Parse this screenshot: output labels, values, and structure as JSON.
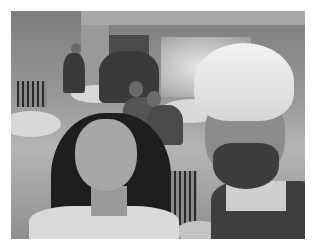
{
  "image": {
    "description": "Grayscale selfie of two people at an indoor event hall; a woman with long dark hair on the left and a smiling bearded man wearing a light turban on the right; round banquet tables with chairs and other attendees in the background.",
    "colors": {
      "background": "#ffffff",
      "tone": "grayscale"
    }
  }
}
